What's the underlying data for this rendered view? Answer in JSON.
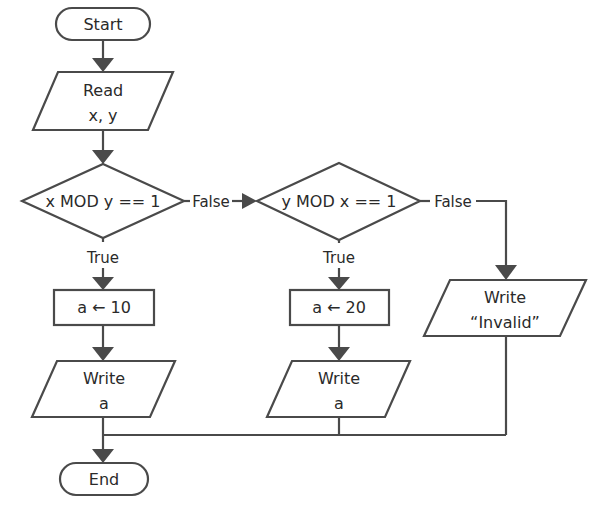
{
  "flowchart": {
    "start": {
      "label": "Start"
    },
    "read": {
      "line1": "Read",
      "line2": "x, y"
    },
    "decision1": {
      "label": "x MOD y == 1",
      "true_label": "True",
      "false_label": "False"
    },
    "decision2": {
      "label": "y MOD x == 1",
      "true_label": "True",
      "false_label": "False"
    },
    "assign1": {
      "label": "a ← 10"
    },
    "assign2": {
      "label": "a ← 20"
    },
    "write1": {
      "line1": "Write",
      "line2": "a"
    },
    "write2": {
      "line1": "Write",
      "line2": "a"
    },
    "write_invalid": {
      "line1": "Write",
      "line2": "“Invalid”"
    },
    "end": {
      "label": "End"
    }
  },
  "colors": {
    "stroke": "#4a4a4a",
    "text": "#2a2a2a",
    "background": "#ffffff"
  }
}
